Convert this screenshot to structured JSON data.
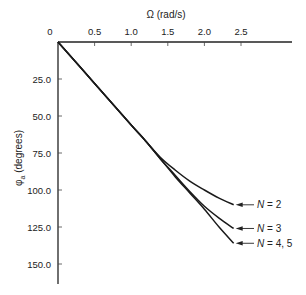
{
  "chart_data": {
    "type": "line",
    "title": "",
    "xlabel": "Ω (rad/s)",
    "ylabel": "φa (degrees)",
    "xlim": [
      0,
      2.95
    ],
    "ylim": [
      0,
      165
    ],
    "y_inverted": true,
    "x_axis_position": "top",
    "grid": false,
    "x_ticks": [
      0,
      0.5,
      1.0,
      1.5,
      2.0,
      2.5
    ],
    "x_tick_labels": [
      "0",
      "0.5",
      "1.0",
      "1.5",
      "2.0",
      "2.5"
    ],
    "y_ticks": [
      25,
      50,
      75,
      100,
      125,
      150
    ],
    "y_tick_labels": [
      "25.0",
      "50.0",
      "75.0",
      "100.0",
      "125.0",
      "150.0"
    ],
    "series": [
      {
        "name": "N = 2",
        "x": [
          0,
          0.5,
          1.0,
          1.2,
          1.4,
          1.6,
          1.8,
          2.0,
          2.2,
          2.4
        ],
        "values": [
          0,
          28,
          56,
          67,
          78,
          86.5,
          94,
          100,
          105.5,
          110
        ]
      },
      {
        "name": "N = 3",
        "x": [
          0,
          0.5,
          1.0,
          1.2,
          1.4,
          1.6,
          1.8,
          2.0,
          2.2,
          2.4
        ],
        "values": [
          0,
          28,
          56,
          67,
          79,
          90,
          101,
          111,
          119,
          126
        ]
      },
      {
        "name": "N = 4, 5",
        "x": [
          0,
          0.5,
          1.0,
          1.2,
          1.4,
          1.6,
          1.8,
          2.0,
          2.2,
          2.4
        ],
        "values": [
          0,
          28,
          56,
          67,
          79,
          91,
          102,
          113,
          125,
          136
        ]
      }
    ],
    "annotations": [
      {
        "text": "N = 2",
        "points_to_series": 0
      },
      {
        "text": "N = 3",
        "points_to_series": 1
      },
      {
        "text": "N = 4, 5",
        "points_to_series": 2
      }
    ],
    "legend": "inline arrow labels at right end of curves"
  }
}
